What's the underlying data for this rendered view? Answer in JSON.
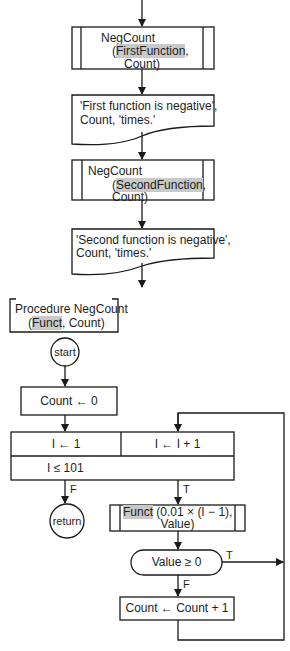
{
  "diagram": {
    "type": "flowchart",
    "main_flow": {
      "call_1": {
        "line1": "NegCount",
        "open_paren": "(",
        "arg_highlight": "FirstFunction",
        "arg_rest": ",",
        "line3": "Count)"
      },
      "output_1": {
        "line1": "'First function is negative',",
        "line2": "Count, 'times.'"
      },
      "call_2": {
        "line1": "NegCount",
        "open_paren": "(",
        "arg_highlight": "SecondFunction",
        "arg_rest": ",",
        "line3": "Count)"
      },
      "output_2": {
        "line1": "'Second function is negative',",
        "line2": "Count, 'times.'"
      }
    },
    "procedure": {
      "header_line1": "Procedure NegCount",
      "header_open": "(",
      "header_highlight": "Funct",
      "header_rest": ", Count)",
      "start": "start",
      "init": "Count ← 0",
      "loop_init": "I ← 1",
      "loop_step": "I ← I + 1",
      "loop_cond": "I ≤ 101",
      "false_label": "F",
      "true_label": "T",
      "return": "return",
      "call_highlight": "Funct",
      "call_rest": " (0.01 × (I − 1),",
      "call_line2": "Value)",
      "decision": "Value ≥ 0",
      "decision_true": "T",
      "decision_false": "F",
      "increment": "Count ← Count + 1"
    },
    "colors": {
      "line": "#1a1a1a",
      "highlight": "#c9c9c9",
      "background": "#ffffff"
    }
  }
}
